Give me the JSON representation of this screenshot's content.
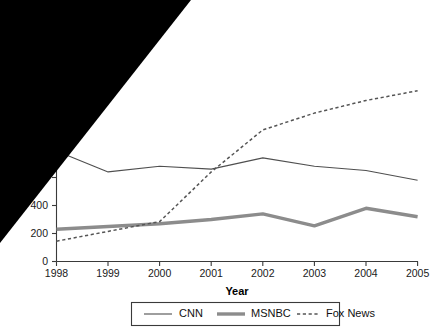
{
  "chart_data": {
    "type": "line",
    "title": "",
    "xlabel": "Year",
    "ylabel": "",
    "x": [
      1998,
      1999,
      2000,
      2001,
      2002,
      2003,
      2004,
      2005
    ],
    "categories": [
      "1998",
      "1999",
      "2000",
      "2001",
      "2002",
      "2003",
      "2004",
      "2005"
    ],
    "xlim": [
      1998,
      2005
    ],
    "ylim": [
      0,
      1300
    ],
    "grid": false,
    "legend_position": "bottom",
    "ytick_labels": [
      "0",
      "200",
      "400",
      "0"
    ],
    "ytick_values": [
      0,
      200,
      400,
      600
    ],
    "ytick_note": "600 label partially occluded by black overlay; only trailing 0 visible",
    "series": [
      {
        "name": "CNN",
        "style": "thin-solid",
        "color": "#4f4f4f",
        "values": [
          790,
          640,
          680,
          660,
          740,
          680,
          650,
          580
        ]
      },
      {
        "name": "MSNBC",
        "style": "thick-solid",
        "color": "#8c8c8c",
        "values": [
          230,
          250,
          270,
          300,
          340,
          255,
          380,
          320
        ]
      },
      {
        "name": "Fox News",
        "style": "dashed",
        "color": "#555555",
        "values": [
          145,
          215,
          285,
          640,
          940,
          1060,
          1150,
          1220
        ]
      }
    ],
    "legend": [
      {
        "label": "CNN",
        "style": "thin-solid"
      },
      {
        "label": "MSNBC",
        "style": "thick-solid"
      },
      {
        "label": "Fox News",
        "style": "dashed"
      }
    ]
  },
  "axis": {
    "x_title": "Year"
  },
  "overlay": {
    "shape": "black-triangle",
    "description": "Solid black triangle occluding upper-left of figure",
    "color": "#000000"
  }
}
